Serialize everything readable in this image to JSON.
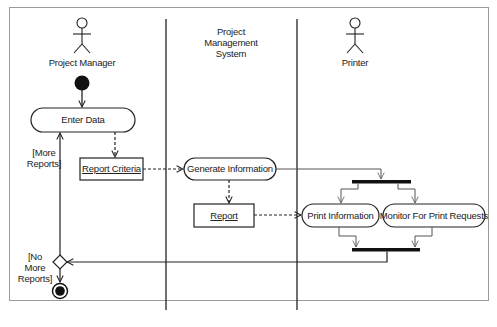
{
  "diagram": {
    "type": "UML activity diagram",
    "swimlanes": [
      {
        "name": "Project Manager",
        "actor": true
      },
      {
        "name": "Project Management System",
        "label_lines": [
          "Project",
          "Management",
          "System"
        ],
        "actor": false
      },
      {
        "name": "Printer",
        "actor": true
      }
    ],
    "nodes": {
      "enter_data": "Enter Data",
      "report_criteria": "Report Criteria",
      "generate_information": "Generate Information",
      "report": "Report",
      "print_information": "Print Information",
      "monitor_print_requests": "Monitor For Print Requests"
    },
    "guards": {
      "more_reports": [
        "[More",
        "Reports]"
      ],
      "no_more_reports": [
        "[No",
        "More",
        "Reports]"
      ]
    },
    "edges": [
      {
        "from": "initial",
        "to": "Enter Data",
        "style": "solid"
      },
      {
        "from": "Enter Data",
        "to": "Report Criteria",
        "style": "dashed"
      },
      {
        "from": "Report Criteria",
        "to": "Generate Information",
        "style": "dashed"
      },
      {
        "from": "Generate Information",
        "to": "Report",
        "style": "dashed"
      },
      {
        "from": "Generate Information",
        "to": "fork",
        "style": "solid"
      },
      {
        "from": "fork",
        "to": "Print Information",
        "style": "solid"
      },
      {
        "from": "fork",
        "to": "Monitor For Print Requests",
        "style": "solid"
      },
      {
        "from": "Report",
        "to": "Print Information",
        "style": "dashed"
      },
      {
        "from": "Print Information",
        "to": "join",
        "style": "solid"
      },
      {
        "from": "Monitor For Print Requests",
        "to": "join",
        "style": "solid"
      },
      {
        "from": "join",
        "to": "decision",
        "style": "solid"
      },
      {
        "from": "decision",
        "to": "Enter Data",
        "guard": "[More Reports]",
        "style": "solid"
      },
      {
        "from": "decision",
        "to": "final",
        "guard": "[No More Reports]",
        "style": "solid"
      }
    ],
    "colors": {
      "line": "#222222",
      "frame": "#9a9a9a",
      "background": "#ffffff"
    }
  }
}
